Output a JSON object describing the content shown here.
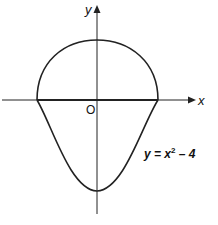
{
  "diagram": {
    "axes": {
      "x_label": "x",
      "y_label": "y",
      "origin_label": "O"
    },
    "curves": [
      {
        "name": "upper-semicircle",
        "description": "semicircle above x-axis from x=-2 to x=2"
      },
      {
        "name": "parabola",
        "equation_prefix": "y = x",
        "equation_exponent": "2",
        "equation_suffix": " – 4"
      }
    ],
    "colors": {
      "stroke": "#222222",
      "background": "#ffffff"
    }
  }
}
